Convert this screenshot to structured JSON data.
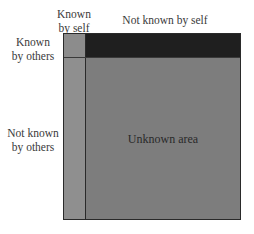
{
  "diagram": {
    "column_headers": [
      "Known by self",
      "Not known by self"
    ],
    "row_headers": [
      "Known by others",
      "Not known by others"
    ],
    "column_header_lines": [
      [
        "Known",
        "by self"
      ],
      [
        "Not known by self"
      ]
    ],
    "row_header_lines": [
      [
        "Known",
        "by others"
      ],
      [
        "Not known",
        "by others"
      ]
    ],
    "quadrants": [
      {
        "name": "open",
        "label": "",
        "color": "#8c8c8c"
      },
      {
        "name": "blind",
        "label": "",
        "color": "#1f1f1f"
      },
      {
        "name": "hidden",
        "label": "",
        "color": "#8f8f8f"
      },
      {
        "name": "unknown",
        "label": "Unknown area",
        "color": "#7d7d7d"
      }
    ]
  }
}
